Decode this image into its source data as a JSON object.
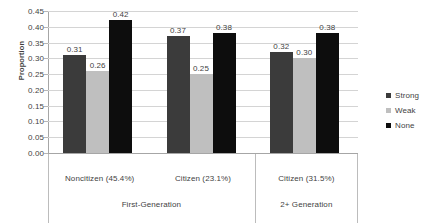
{
  "chart_data": {
    "type": "bar",
    "title": "",
    "xlabel": "",
    "ylabel": "Proportion",
    "ylim": [
      0.0,
      0.45
    ],
    "ytick_step": 0.05,
    "ytick_labels": [
      "0.45",
      "0.40",
      "0.35",
      "0.30",
      "0.25",
      "0.20",
      "0.15",
      "0.10",
      "0.05",
      "0.00"
    ],
    "ytick_values": [
      0.45,
      0.4,
      0.35,
      0.3,
      0.25,
      0.2,
      0.15,
      0.1,
      0.05,
      0.0
    ],
    "grid": true,
    "legend_position": "right",
    "categories": [
      "Noncitizen (45.4%)",
      "Citizen (23.1%)",
      "Citizen (31.5%)"
    ],
    "groups": [
      {
        "label": "First-Generation",
        "categories": [
          "Noncitizen (45.4%)",
          "Citizen (23.1%)"
        ]
      },
      {
        "label": "2+ Generation",
        "categories": [
          "Citizen (31.5%)"
        ]
      }
    ],
    "series": [
      {
        "name": "Strong",
        "color": "#3b3b3b",
        "values": [
          0.31,
          0.37,
          0.32
        ],
        "labels": [
          "0.31",
          "0.37",
          "0.32"
        ]
      },
      {
        "name": "Weak",
        "color": "#bfbfbf",
        "values": [
          0.26,
          0.25,
          0.3
        ],
        "labels": [
          "0.26",
          "0.25",
          "0.30"
        ]
      },
      {
        "name": "None",
        "color": "#0d0d0d",
        "values": [
          0.42,
          0.38,
          0.38
        ],
        "labels": [
          "0.42",
          "0.38",
          "0.38"
        ]
      }
    ]
  },
  "legend": {
    "items": [
      {
        "label": "Strong"
      },
      {
        "label": "Weak"
      },
      {
        "label": "None"
      }
    ]
  }
}
